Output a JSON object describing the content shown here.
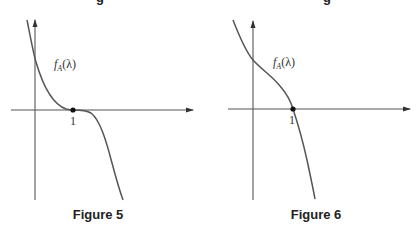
{
  "figures": [
    {
      "caption": "Figure 5",
      "function_label_base": "f",
      "function_label_sub": "A",
      "function_label_arg": "(λ)",
      "tick_label": "1",
      "description": "Characteristic polynomial with a triple root at λ = 1 (curve flattens and touches x-axis at 1)"
    },
    {
      "caption": "Figure 6",
      "function_label_base": "f",
      "function_label_sub": "A",
      "function_label_arg": "(λ)",
      "tick_label": "1",
      "description": "Characteristic polynomial with a single real root at λ = 1 (curve crosses x-axis at 1)"
    }
  ],
  "colors": {
    "ink": "#555555",
    "text": "#333333",
    "background": "#ffffff"
  }
}
